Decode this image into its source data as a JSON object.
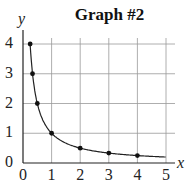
{
  "chart_data": {
    "type": "line",
    "title": "Graph #2",
    "xlabel": "x",
    "ylabel": "y",
    "xlim": [
      0,
      5
    ],
    "ylim": [
      0,
      4
    ],
    "grid": true,
    "x_ticks": [
      "0",
      "1",
      "2",
      "3",
      "4",
      "5"
    ],
    "y_ticks": [
      "0",
      "1",
      "2",
      "3",
      "4"
    ],
    "series": [
      {
        "name": "y = 1/x",
        "points": [
          [
            0.25,
            4
          ],
          [
            0.333,
            3
          ],
          [
            0.5,
            2
          ],
          [
            1,
            1
          ],
          [
            2,
            0.5
          ],
          [
            3,
            0.333
          ],
          [
            4,
            0.25
          ]
        ],
        "curve_end": [
          5,
          0.2
        ]
      }
    ]
  }
}
